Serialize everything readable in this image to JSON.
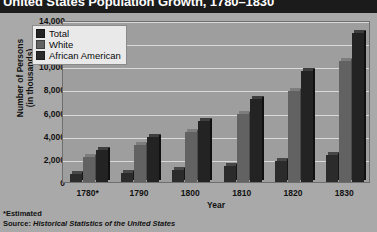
{
  "title": "United States Population Growth, 1780–1830",
  "chart_data": {
    "type": "bar",
    "title": "United States Population Growth, 1780–1830",
    "xlabel": "Year",
    "ylabel": "Number of Persons\n(in thousands)",
    "ylabel_line1": "Number of Persons",
    "ylabel_line2": "(in thousands)",
    "categories": [
      "1780*",
      "1790",
      "1800",
      "1810",
      "1820",
      "1830"
    ],
    "yticks": [
      "0",
      "2,000",
      "4,000",
      "6,000",
      "8,000",
      "10,000",
      "12,000",
      "14,000"
    ],
    "ytick_values": [
      0,
      2000,
      4000,
      6000,
      8000,
      10000,
      12000,
      14000
    ],
    "ylim": [
      0,
      14000
    ],
    "grid": true,
    "legend_position": "upper-left-inside",
    "series": [
      {
        "name": "African American",
        "color": "#2b2b2b",
        "values": [
          700,
          800,
          1000,
          1400,
          1800,
          2300
        ]
      },
      {
        "name": "White",
        "color": "#626262",
        "values": [
          2200,
          3200,
          4300,
          5900,
          7900,
          10500
        ]
      },
      {
        "name": "Total",
        "color": "#232323",
        "values": [
          2800,
          3900,
          5300,
          7200,
          9600,
          12900
        ]
      }
    ],
    "legend_order": [
      "Total",
      "White",
      "African American"
    ]
  },
  "legend": {
    "items": [
      {
        "label": "Total",
        "color": "#232323"
      },
      {
        "label": "White",
        "color": "#626262"
      },
      {
        "label": "African American",
        "color": "#2b2b2b"
      }
    ]
  },
  "notes": {
    "estimated": "*Estimated",
    "source_prefix": "Source: ",
    "source_title": "Historical Statistics of the United States"
  }
}
